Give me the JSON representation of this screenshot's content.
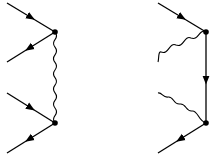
{
  "diagram": {
    "type": "feynman-diagrams",
    "panels": [
      {
        "id": "left",
        "description": "Two fermion lines exchanging a photon (wavy propagator) between two vertices",
        "vertices": [
          {
            "x": 55,
            "y": 32
          },
          {
            "x": 55,
            "y": 123
          }
        ],
        "external_lines": [
          {
            "from": [
              7,
              3
            ],
            "to": [
              55,
              32
            ],
            "arrow": "in"
          },
          {
            "from": [
              55,
              32
            ],
            "to": [
              7,
              62
            ],
            "arrow": "out"
          },
          {
            "from": [
              7,
              93
            ],
            "to": [
              55,
              123
            ],
            "arrow": "in"
          },
          {
            "from": [
              55,
              123
            ],
            "to": [
              7,
              153
            ],
            "arrow": "out"
          }
        ],
        "internal_line": {
          "kind": "photon-wavy",
          "from": [
            55,
            32
          ],
          "to": [
            55,
            123
          ]
        }
      },
      {
        "id": "right",
        "description": "Fermion line emitting/absorbing two photons with internal fermion propagator",
        "vertices": [
          {
            "x": 206,
            "y": 32
          },
          {
            "x": 206,
            "y": 123
          }
        ],
        "external_lines": [
          {
            "from": [
              158,
              3
            ],
            "to": [
              206,
              32
            ],
            "arrow": "in"
          },
          {
            "from": [
              206,
              123
            ],
            "to": [
              158,
              153
            ],
            "arrow": "out"
          }
        ],
        "photon_lines": [
          {
            "kind": "photon-wavy",
            "from": [
              206,
              32
            ],
            "to": [
              158,
              62
            ]
          },
          {
            "kind": "photon-wavy",
            "from": [
              158,
              93
            ],
            "to": [
              206,
              123
            ]
          }
        ],
        "internal_line": {
          "kind": "fermion",
          "from": [
            206,
            32
          ],
          "to": [
            206,
            123
          ],
          "arrow": "down"
        }
      }
    ],
    "colors": {
      "line": "#000000",
      "background": "#ffffff"
    }
  }
}
